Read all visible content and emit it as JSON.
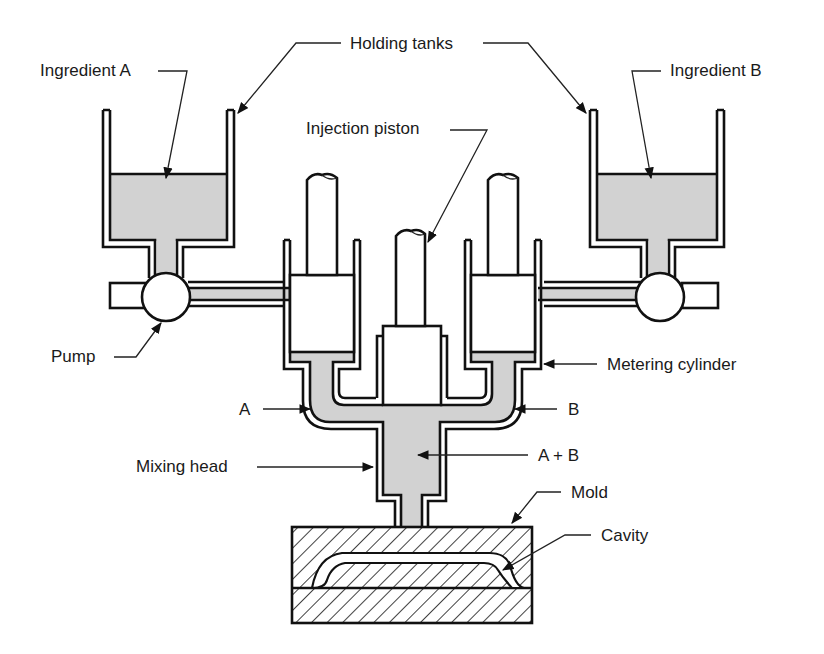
{
  "diagram": {
    "labels": {
      "holding_tanks": "Holding tanks",
      "ingredient_a": "Ingredient A",
      "ingredient_b": "Ingredient B",
      "injection_piston": "Injection piston",
      "pump": "Pump",
      "metering_cylinder": "Metering cylinder",
      "a": "A",
      "b": "B",
      "mixing_head": "Mixing head",
      "a_plus_b": "A + B",
      "mold": "Mold",
      "cavity": "Cavity"
    },
    "colors": {
      "line": "#111111",
      "liquid": "#d2d2d2",
      "background": "#ffffff"
    }
  }
}
